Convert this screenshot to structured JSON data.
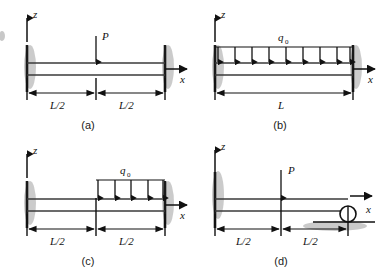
{
  "figure": {
    "background_color": "#ffffff",
    "ink_color": "#111111",
    "shadow_color": "#b9b9b9",
    "panel_count": 4
  },
  "panels": [
    {
      "id": "panel-a",
      "caption": "(a)",
      "support_left": "fixed-wall",
      "support_right": "fixed-wall",
      "axis_z_label": "z",
      "axis_x_label": "x",
      "load_type": "point",
      "load_label": "P",
      "load_count": 1,
      "load_position": "midspan",
      "dimensions": [
        "L/2",
        "L/2"
      ]
    },
    {
      "id": "panel-b",
      "caption": "(b)",
      "support_left": "fixed-wall",
      "support_right": "fixed-wall",
      "axis_z_label": "z",
      "axis_x_label": "x",
      "load_type": "uniform-distributed",
      "load_label": "q",
      "load_label_sub": "0",
      "load_count": 9,
      "load_position": "full-span",
      "dimensions": [
        "L"
      ]
    },
    {
      "id": "panel-c",
      "caption": "(c)",
      "support_left": "fixed-wall",
      "support_right": "fixed-wall",
      "axis_z_label": "z",
      "axis_x_label": "x",
      "load_type": "uniform-distributed",
      "load_label": "q",
      "load_label_sub": "0",
      "load_count": 5,
      "load_position": "right-half",
      "dimensions": [
        "L/2",
        "L/2"
      ]
    },
    {
      "id": "panel-d",
      "caption": "(d)",
      "support_left": "fixed-wall",
      "support_right": "roller",
      "axis_z_label": "z",
      "axis_x_label": "x",
      "load_type": "point",
      "load_label": "P",
      "load_count": 1,
      "load_position": "midspan",
      "dimensions": [
        "L/2",
        "L/2"
      ]
    }
  ]
}
